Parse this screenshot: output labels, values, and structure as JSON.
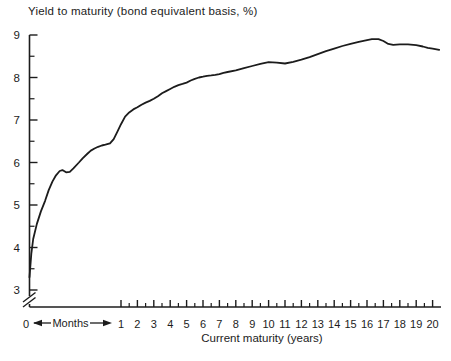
{
  "figure": {
    "background": "#ffffff",
    "ink_color": "#1c1c1c"
  },
  "chart_data": {
    "type": "line",
    "title": "Yield to maturity (bond equivalent basis, %)",
    "xlabel": "Current maturity (years)",
    "legend": "none",
    "grid": "off",
    "x_axis": {
      "origin_label": "0",
      "months_segment_label": "Months",
      "year_tick_labels": [
        "1",
        "2",
        "3",
        "4",
        "5",
        "6",
        "7",
        "8",
        "9",
        "10",
        "11",
        "12",
        "13",
        "14",
        "15",
        "16",
        "17",
        "18",
        "19",
        "20"
      ],
      "minor_tick_interval_years": 0.5,
      "range_years": [
        0,
        20
      ]
    },
    "y_axis": {
      "tick_labels": [
        "9",
        "8",
        "7",
        "6",
        "5",
        "4",
        "3"
      ],
      "tick_values": [
        9,
        8,
        7,
        6,
        5,
        4,
        3
      ],
      "minor_tick_interval": 0.5,
      "range": [
        3,
        9
      ],
      "axis_break_below": 3
    },
    "series": [
      {
        "name": "yield-curve",
        "color": "#1c1c1c",
        "points_year_pct": [
          [
            0,
            3.3
          ],
          [
            0.02,
            3.85
          ],
          [
            0.04,
            4.2
          ],
          [
            0.08,
            4.55
          ],
          [
            0.125,
            4.85
          ],
          [
            0.17,
            5.1
          ],
          [
            0.21,
            5.35
          ],
          [
            0.25,
            5.55
          ],
          [
            0.29,
            5.7
          ],
          [
            0.33,
            5.8
          ],
          [
            0.36,
            5.82
          ],
          [
            0.4,
            5.77
          ],
          [
            0.44,
            5.78
          ],
          [
            0.48,
            5.86
          ],
          [
            0.54,
            6.0
          ],
          [
            0.58,
            6.1
          ],
          [
            0.63,
            6.2
          ],
          [
            0.67,
            6.28
          ],
          [
            0.71,
            6.33
          ],
          [
            0.75,
            6.37
          ],
          [
            0.79,
            6.4
          ],
          [
            0.83,
            6.42
          ],
          [
            0.88,
            6.45
          ],
          [
            0.92,
            6.55
          ],
          [
            0.96,
            6.72
          ],
          [
            1.0,
            6.9
          ],
          [
            1.25,
            7.08
          ],
          [
            1.5,
            7.18
          ],
          [
            1.75,
            7.25
          ],
          [
            2.0,
            7.3
          ],
          [
            2.25,
            7.36
          ],
          [
            2.5,
            7.41
          ],
          [
            2.75,
            7.45
          ],
          [
            3.0,
            7.5
          ],
          [
            3.25,
            7.56
          ],
          [
            3.5,
            7.63
          ],
          [
            3.75,
            7.68
          ],
          [
            4.0,
            7.73
          ],
          [
            4.25,
            7.78
          ],
          [
            4.5,
            7.82
          ],
          [
            4.75,
            7.85
          ],
          [
            5.0,
            7.88
          ],
          [
            5.25,
            7.93
          ],
          [
            5.5,
            7.97
          ],
          [
            5.75,
            8.0
          ],
          [
            6.0,
            8.02
          ],
          [
            6.25,
            8.04
          ],
          [
            6.5,
            8.05
          ],
          [
            6.75,
            8.06
          ],
          [
            7.0,
            8.08
          ],
          [
            7.25,
            8.11
          ],
          [
            7.5,
            8.13
          ],
          [
            8.0,
            8.17
          ],
          [
            8.5,
            8.22
          ],
          [
            9.0,
            8.27
          ],
          [
            9.5,
            8.32
          ],
          [
            10.0,
            8.36
          ],
          [
            10.5,
            8.35
          ],
          [
            11.0,
            8.33
          ],
          [
            11.5,
            8.37
          ],
          [
            12.0,
            8.42
          ],
          [
            12.5,
            8.48
          ],
          [
            13.0,
            8.55
          ],
          [
            13.5,
            8.62
          ],
          [
            14.0,
            8.68
          ],
          [
            14.5,
            8.74
          ],
          [
            15.0,
            8.79
          ],
          [
            15.5,
            8.84
          ],
          [
            16.0,
            8.88
          ],
          [
            16.3,
            8.9
          ],
          [
            16.7,
            8.9
          ],
          [
            17.0,
            8.86
          ],
          [
            17.3,
            8.79
          ],
          [
            17.6,
            8.77
          ],
          [
            18.0,
            8.78
          ],
          [
            18.5,
            8.78
          ],
          [
            19.0,
            8.76
          ],
          [
            19.4,
            8.73
          ],
          [
            19.7,
            8.7
          ],
          [
            20.0,
            8.68
          ],
          [
            20.4,
            8.65
          ]
        ]
      }
    ]
  }
}
